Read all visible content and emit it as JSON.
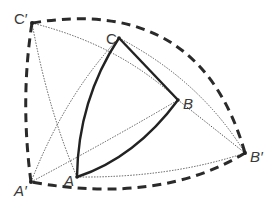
{
  "figure": {
    "colors": {
      "background": "#ffffff",
      "solid_stroke": "#222222",
      "dashed_stroke": "#2a2a2a",
      "dotted_stroke": "#555555",
      "label": "#3a3a3a"
    },
    "points": {
      "A": {
        "x": 77,
        "y": 177
      },
      "B": {
        "x": 178,
        "y": 100
      },
      "C": {
        "x": 119,
        "y": 38
      },
      "A_prime": {
        "x": 31,
        "y": 182
      },
      "B_prime": {
        "x": 245,
        "y": 153
      },
      "C_prime": {
        "x": 32,
        "y": 23
      }
    },
    "labels": {
      "A": "A",
      "B": "B",
      "C": "C",
      "A_prime": "A′",
      "B_prime": "B′",
      "C_prime": "C′"
    },
    "edges": {
      "solid_triangle": [
        "A-C",
        "C-B",
        "B-A"
      ],
      "dashed_triangle": [
        "C'-B'",
        "B'-A'",
        "A'-C'"
      ],
      "dotted_arcs": [
        "C'-A",
        "C'-B",
        "A'-C",
        "A'-B",
        "A-B'",
        "C-B'",
        "B-B'"
      ]
    }
  }
}
